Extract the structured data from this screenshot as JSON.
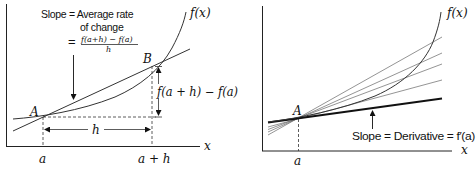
{
  "left_panel": {
    "curve_label": "f(x)",
    "x_axis_label": "x",
    "point_a_label": "A",
    "point_b_label": "B",
    "tick_a_label": "a",
    "tick_a_plus_h_label": "a + h",
    "h_label": "h",
    "rise_label": "f(a + h) − f(a)",
    "annotation": {
      "line1": "Slope = Average rate",
      "line2": "of change",
      "equals": "=",
      "numerator": "f(a+h) − f(a)",
      "denominator": "h"
    }
  },
  "right_panel": {
    "curve_label": "f(x)",
    "x_axis_label": "x",
    "point_a_label": "A",
    "tick_a_label": "a",
    "annotation": "Slope = Derivative = f′(a)"
  },
  "colors": {
    "ink": "#111111",
    "secant_gray": "#555555"
  }
}
